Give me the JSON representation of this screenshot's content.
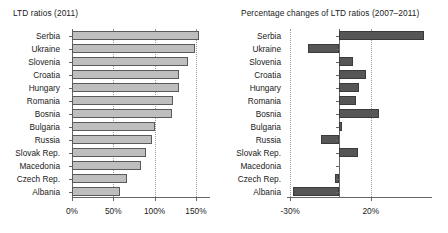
{
  "figure": {
    "width": 448,
    "height": 233,
    "background": "#ffffff",
    "bar_fill_left": "#bebebe",
    "bar_fill_right": "#565656",
    "axis_color": "#666666",
    "grid_color": "#9a9a9a"
  },
  "chart_data": [
    {
      "id": "ltd-ratios-2011",
      "type": "bar",
      "orientation": "horizontal",
      "title": "LTD ratios (2011)",
      "xlabel": "",
      "ylabel": "",
      "categories": [
        "Serbia",
        "Ukraine",
        "Slovenia",
        "Croatia",
        "Hungary",
        "Romania",
        "Bosnia",
        "Bulgaria",
        "Russia",
        "Slovak Rep.",
        "Macedonia",
        "Czech Rep.",
        "Albania"
      ],
      "values": [
        154,
        150,
        140,
        128,
        130,
        131,
        122,
        121,
        99,
        96,
        88,
        82,
        67,
        58
      ],
      "series": [
        {
          "name": "LTD ratio 2011",
          "values": [
            154,
            149,
            140,
            129,
            130,
            122,
            121,
            100,
            97,
            89,
            84,
            67,
            58
          ]
        }
      ],
      "xticks": [
        0,
        50,
        100,
        150
      ],
      "xticklabels": [
        "0%",
        "50%",
        "100%",
        "150%"
      ],
      "xlim": [
        0,
        167
      ],
      "grid": "vertical-dotted",
      "legend": "none"
    },
    {
      "id": "ltd-percentage-changes-2007-2011",
      "type": "bar",
      "orientation": "horizontal",
      "title": "Percentage changes of LTD ratios (2007–2011)",
      "xlabel": "",
      "ylabel": "",
      "categories": [
        "Serbia",
        "Ukraine",
        "Slovenia",
        "Croatia",
        "Hungary",
        "Romania",
        "Bosnia",
        "Bulgaria",
        "Russia",
        "Slovak Rep.",
        "Macedonia",
        "Czech Rep.",
        "Albania"
      ],
      "series": [
        {
          "name": "Percentage change 2007-2011",
          "values": [
            53,
            -19,
            9,
            17,
            13,
            11,
            25,
            2,
            -11,
            12,
            0,
            -2,
            -28
          ]
        }
      ],
      "xticks": [
        -30,
        20
      ],
      "xticklabels": [
        "-30%",
        "20%"
      ],
      "xlim": [
        -32,
        58
      ],
      "grid": "vertical-dotted",
      "legend": "none"
    }
  ]
}
